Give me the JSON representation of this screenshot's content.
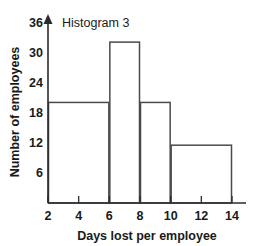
{
  "chart_data": {
    "type": "bar",
    "title": "Histogram 3",
    "xlabel": "Days lost per employee",
    "ylabel": "Number of employees",
    "xlim": [
      2,
      14
    ],
    "ylim": [
      0,
      36
    ],
    "grid": false,
    "legend": null,
    "x_ticks": [
      "2",
      "4",
      "6",
      "8",
      "10",
      "12",
      "14"
    ],
    "x_tick_values": [
      2,
      4,
      6,
      8,
      10,
      12,
      14
    ],
    "y_ticks": [
      "6",
      "12",
      "18",
      "24",
      "30",
      "36"
    ],
    "y_tick_values": [
      6,
      12,
      18,
      24,
      30,
      36
    ],
    "bins": [
      {
        "label": "2-6",
        "x_start": 2,
        "x_end": 6,
        "value": 20
      },
      {
        "label": "6-8",
        "x_start": 6,
        "x_end": 8,
        "value": 32
      },
      {
        "label": "8-10",
        "x_start": 8,
        "x_end": 10,
        "value": 20
      },
      {
        "label": "10-14",
        "x_start": 10,
        "x_end": 14,
        "value": 11.5
      }
    ],
    "categories": [
      "2-6",
      "6-8",
      "8-10",
      "10-14"
    ],
    "values": [
      20,
      32,
      20,
      11.5
    ],
    "colors": {
      "bar_fill": "#ffffff",
      "bar_stroke": "#4a4a4a",
      "axis": "#2b2b2b",
      "text": "#1a1a1a",
      "background": "#ffffff"
    }
  }
}
